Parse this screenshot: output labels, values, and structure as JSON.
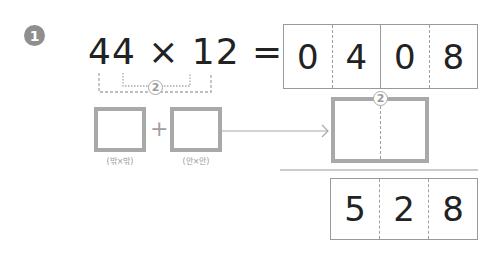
{
  "problem": {
    "number": "1",
    "equation": "44 × 12 =",
    "bracket_label": "2",
    "outer_label": "(밖×밖)",
    "inner_label": "(안×안)",
    "plus": "+",
    "partial_product_digits": [
      "0",
      "4",
      "0",
      "8"
    ],
    "middle_box_label": "2",
    "answer_digits": [
      "5",
      "2",
      "8"
    ]
  },
  "colors": {
    "box_border": "#a9a9a9",
    "text": "#222222",
    "badge": "#8f8f8f"
  }
}
